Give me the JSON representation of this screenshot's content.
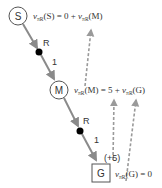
{
  "diagram": {
    "nodes": {
      "S": {
        "label": "S",
        "shape": "circle"
      },
      "M": {
        "label": "M",
        "shape": "circle"
      },
      "G": {
        "label": "G",
        "shape": "square"
      }
    },
    "edges": [
      {
        "from": "S",
        "to": "M",
        "action": "R",
        "probability": "1"
      },
      {
        "from": "M",
        "to": "G",
        "action": "R",
        "probability": "1"
      }
    ],
    "equations": {
      "S": {
        "v": "v",
        "sub": "πR",
        "lhs_arg": "(S) = 0 + ",
        "rhs_v": "v",
        "rhs_sub": "πR",
        "rhs_arg": "(M)"
      },
      "M": {
        "v": "v",
        "sub": "πR",
        "lhs_arg": "(M) = 5 + ",
        "rhs_v": "v",
        "rhs_sub": "πR",
        "rhs_arg": "(G)"
      },
      "G": {
        "v": "v",
        "sub": "πR",
        "lhs_arg": "(G) = 0"
      }
    },
    "reward_label": "(+5)",
    "colors": {
      "edge": "#8a8a8a",
      "dashed": "#9a9a9a",
      "dot": "#000000",
      "node_stroke": "#555555",
      "text": "#333333"
    }
  }
}
